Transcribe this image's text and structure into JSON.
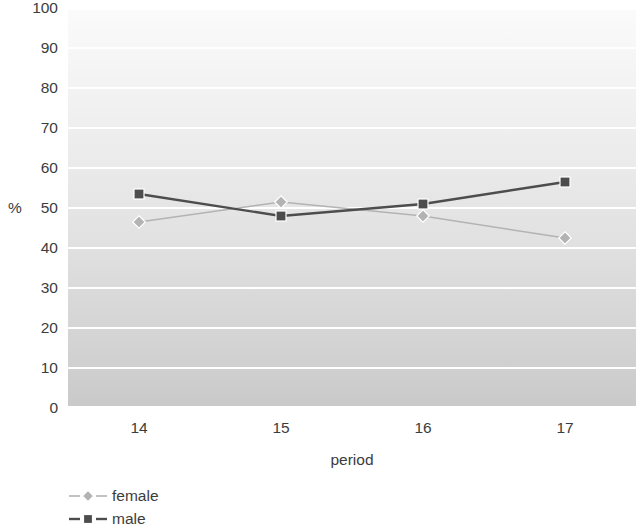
{
  "chart_data": {
    "type": "line",
    "title": "",
    "xlabel": "period",
    "ylabel": "%",
    "categories": [
      "14",
      "15",
      "16",
      "17"
    ],
    "ylim": [
      0,
      100
    ],
    "yticks": [
      "100",
      "90",
      "80",
      "70",
      "60",
      "50",
      "40",
      "30",
      "20",
      "10",
      "0"
    ],
    "ytick_values": [
      100,
      90,
      80,
      70,
      60,
      50,
      40,
      30,
      20,
      10,
      0
    ],
    "grid": true,
    "legend_position": "bottom-left",
    "series": [
      {
        "name": "female",
        "values": [
          46.5,
          51.5,
          48.0,
          42.5
        ],
        "color": "#b3b3b3",
        "marker": "diamond"
      },
      {
        "name": "male",
        "values": [
          53.5,
          48.0,
          51.0,
          56.5
        ],
        "color": "#4d4d4d",
        "marker": "square"
      }
    ]
  },
  "legend": {
    "items": [
      {
        "label": "female",
        "icon": "diamond-marker-icon"
      },
      {
        "label": "male",
        "icon": "square-marker-icon"
      }
    ]
  },
  "colors": {
    "female_series": "#b3b3b3",
    "male_series": "#4d4d4d",
    "gridline": "#ffffff",
    "text": "#3c3c3c"
  }
}
